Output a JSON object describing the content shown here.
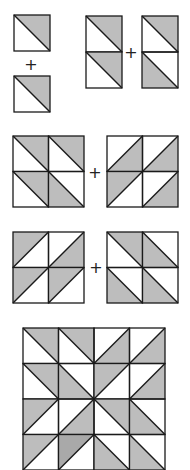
{
  "colors": {
    "shade": "#bdbdbd",
    "shade_dark": "#a9a9a9",
    "line": "#1a1a1a",
    "background": "#ffffff"
  },
  "legend": {
    "orientation_key": "Each cell: diag 'tlbr' = line from top-left to bottom-right, 'bltr' = bottom-left to top-right; shade names the shaded triangle (ur, ll, ul, lr)"
  },
  "operators": [
    {
      "symbol": "+",
      "x": 24,
      "y": 57
    },
    {
      "symbol": "+",
      "x": 124,
      "y": 45
    },
    {
      "symbol": "+",
      "x": 88,
      "y": 165
    },
    {
      "symbol": "+",
      "x": 89,
      "y": 260
    }
  ],
  "blocks": [
    {
      "name": "single-square-top",
      "x": 14,
      "y": 15,
      "cell": 36,
      "rows": 1,
      "cols": 1,
      "cells": [
        [
          "ur"
        ]
      ]
    },
    {
      "name": "single-square-bottom",
      "x": 14,
      "y": 76,
      "cell": 36,
      "rows": 1,
      "cols": 1,
      "cells": [
        [
          "ur"
        ]
      ]
    },
    {
      "name": "strip-left",
      "x": 86,
      "y": 16,
      "cell": 36,
      "rows": 2,
      "cols": 1,
      "cells": [
        [
          "ur"
        ],
        [
          "ur"
        ]
      ]
    },
    {
      "name": "strip-right",
      "x": 142,
      "y": 16,
      "cell": 36,
      "rows": 2,
      "cols": 1,
      "cells": [
        [
          "ur"
        ],
        [
          "ll"
        ]
      ]
    },
    {
      "name": "block-a",
      "x": 13,
      "y": 136,
      "cell": 35.5,
      "rows": 2,
      "cols": 2,
      "cells": [
        [
          "ur",
          "ur"
        ],
        [
          "ur",
          "ll"
        ]
      ]
    },
    {
      "name": "block-b",
      "x": 107,
      "y": 136,
      "cell": 35.5,
      "rows": 2,
      "cols": 2,
      "cells": [
        [
          "lr",
          "lr"
        ],
        [
          "ul",
          "lr"
        ]
      ]
    },
    {
      "name": "block-c",
      "x": 13,
      "y": 232,
      "cell": 35.5,
      "rows": 2,
      "cols": 2,
      "cells": [
        [
          "ul",
          "lr"
        ],
        [
          "ul",
          "ul"
        ]
      ]
    },
    {
      "name": "block-d",
      "x": 107,
      "y": 232,
      "cell": 35.5,
      "rows": 2,
      "cols": 2,
      "cells": [
        [
          "ur",
          "ll"
        ],
        [
          "ll",
          "ll"
        ]
      ]
    },
    {
      "name": "quilt-4x4",
      "x": 23,
      "y": 328,
      "cell": 35.5,
      "rows": 4,
      "cols": 4,
      "cells": [
        [
          "ur",
          "ur",
          "lr",
          "lr"
        ],
        [
          "ur",
          "ll",
          "ul",
          "lr"
        ],
        [
          "ul",
          "lr",
          "ur",
          "ll"
        ],
        [
          "ul",
          "ul*",
          "ll",
          "ll"
        ]
      ]
    }
  ]
}
